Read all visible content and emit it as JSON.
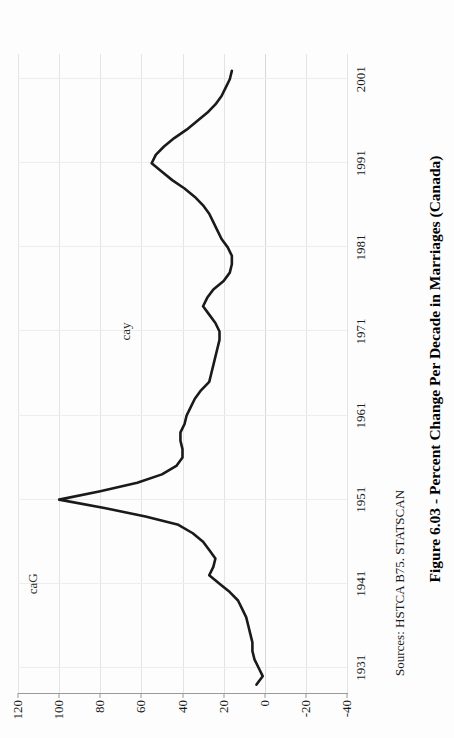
{
  "figure": {
    "caption": "Figure 6.03 - Percent Change Per Decade in Marriages (Canada)",
    "source": "Sources: HSTCA B75. STATSCAN",
    "orientation": "rotated-90-ccw",
    "page_background": "#ffffff",
    "line_color": "#1a1a1a",
    "grid_color": "#e6e6e6",
    "axis_color": "#9a9a9a"
  },
  "annotations": [
    {
      "text": "caG",
      "x_year": 1941,
      "y_value": 100
    },
    {
      "text": "cay",
      "x_year": 1971,
      "y_value": 55
    }
  ],
  "chart_data": {
    "type": "line",
    "title": "Figure 6.03 - Percent Change Per Decade in Marriages (Canada)",
    "xlabel": "",
    "ylabel": "",
    "xlim": [
      1928,
      2004
    ],
    "ylim": [
      -40,
      120
    ],
    "grid": true,
    "legend": false,
    "x_ticks": [
      "1931",
      "1941",
      "1951",
      "1961",
      "1971",
      "1981",
      "1991",
      "2001"
    ],
    "x_tick_values": [
      1931,
      1941,
      1951,
      1961,
      1971,
      1981,
      1991,
      2001
    ],
    "y_ticks": [
      "120",
      "100",
      "80",
      "60",
      "40",
      "20",
      "0",
      "-20",
      "-40"
    ],
    "y_tick_values": [
      120,
      100,
      80,
      60,
      40,
      20,
      0,
      -20,
      -40
    ],
    "series": [
      {
        "name": "Percent change per decade in marriages",
        "x": [
          1929,
          1930,
          1931,
          1932,
          1933,
          1934,
          1935,
          1936,
          1937,
          1938,
          1939,
          1940,
          1941,
          1942,
          1943,
          1944,
          1945,
          1946,
          1947,
          1948,
          1949,
          1950,
          1951,
          1952,
          1953,
          1954,
          1955,
          1956,
          1957,
          1958,
          1959,
          1960,
          1961,
          1962,
          1963,
          1964,
          1965,
          1966,
          1967,
          1968,
          1969,
          1970,
          1971,
          1972,
          1973,
          1974,
          1975,
          1976,
          1977,
          1978,
          1979,
          1980,
          1981,
          1982,
          1983,
          1984,
          1985,
          1986,
          1987,
          1988,
          1989,
          1990,
          1991,
          1992,
          1993,
          1994,
          1995,
          1996,
          1997,
          1998,
          1999,
          2000,
          2001,
          2002
        ],
        "y": [
          4,
          1,
          3,
          5,
          6,
          6,
          7,
          8,
          9,
          11,
          13,
          17,
          22,
          27,
          25,
          24,
          27,
          30,
          35,
          42,
          58,
          78,
          100,
          80,
          62,
          50,
          43,
          40,
          40,
          41,
          41,
          39,
          38,
          36,
          34,
          31,
          27,
          26,
          25,
          24,
          23,
          22,
          22,
          24,
          27,
          30,
          28,
          25,
          20,
          17,
          16,
          16,
          18,
          21,
          23,
          25,
          27,
          30,
          34,
          39,
          45,
          50,
          55,
          53,
          49,
          44,
          38,
          33,
          28,
          24,
          21,
          19,
          17,
          16
        ]
      }
    ],
    "extra_tail": {
      "note": "curve continues right of 1951 peak toward 2001",
      "x": [
        2002,
        2003,
        2004
      ],
      "y": [
        15,
        14,
        13
      ]
    }
  }
}
